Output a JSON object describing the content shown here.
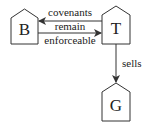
{
  "diagram": {
    "nodes": [
      {
        "id": "B",
        "label": "B"
      },
      {
        "id": "T",
        "label": "T"
      },
      {
        "id": "G",
        "label": "G"
      }
    ],
    "edges": [
      {
        "from": "T",
        "to": "B",
        "label": "covenants"
      },
      {
        "from": "B",
        "to": "T",
        "label_lines": [
          "remain",
          "enforceable"
        ]
      },
      {
        "from": "T",
        "to": "G",
        "label": "sells"
      }
    ],
    "colors": {
      "stroke": "#333333",
      "background": "#ffffff"
    }
  }
}
